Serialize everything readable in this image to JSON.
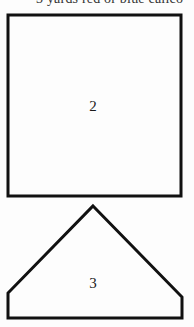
{
  "header": {
    "clipped_text": "3 yards red or blue calico"
  },
  "pattern_pieces": [
    {
      "id": 2,
      "label": "2",
      "shape": "square",
      "points": "8,15 181,15 181,196 8,196"
    },
    {
      "id": 3,
      "label": "3",
      "shape": "pentagon",
      "points": "93,206 182,297 182,318 8,318 8,293"
    }
  ],
  "colors": {
    "outline": "#111111",
    "background": "#fdfdfd",
    "text": "#1a1a1a"
  }
}
